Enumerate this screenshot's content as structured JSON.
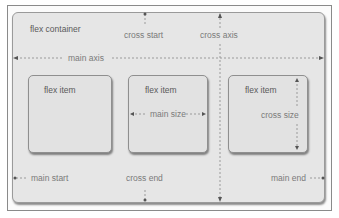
{
  "diagram": {
    "container_label": "flex container",
    "items": [
      {
        "label": "flex item"
      },
      {
        "label": "flex item",
        "annotation": "main size"
      },
      {
        "label": "flex item",
        "annotation": "cross size"
      }
    ],
    "axes": {
      "main_axis": "main axis",
      "cross_axis": "cross axis",
      "cross_start": "cross start",
      "cross_end": "cross end",
      "main_start": "main start",
      "main_end": "main end"
    },
    "colors": {
      "container_fill": "#e6e6e6",
      "item_fill": "#e2e2e2",
      "border": "#8f8f8f",
      "label_text": "#7a7a7a",
      "dashed_line": "#9a9a9a",
      "arrow_head": "#555555"
    }
  }
}
